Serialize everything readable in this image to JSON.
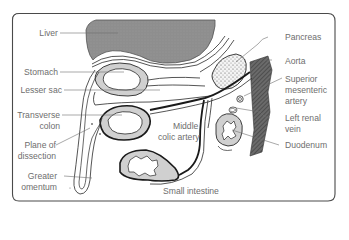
{
  "figure": {
    "colors": {
      "border": "#4a4a4a",
      "liver_fill": "#8c8c8c",
      "organ_wall": "#cfcfcf",
      "line": "#2a2a2a",
      "label_text": "#6e6e6e",
      "aorta_fill": "#5a5a5a"
    }
  },
  "labels": {
    "left": [
      {
        "id": "liver",
        "text": "Liver"
      },
      {
        "id": "stomach",
        "text": "Stomach"
      },
      {
        "id": "lesser_sac",
        "text": "Lesser sac"
      },
      {
        "id": "transverse_colon_1",
        "text": "Transverse"
      },
      {
        "id": "transverse_colon_2",
        "text": "colon"
      },
      {
        "id": "plane_1",
        "text": "Plane of"
      },
      {
        "id": "plane_2",
        "text": "dissection"
      },
      {
        "id": "greater_omentum_1",
        "text": "Greater"
      },
      {
        "id": "greater_omentum_2",
        "text": "omentum"
      }
    ],
    "right": [
      {
        "id": "pancreas",
        "text": "Pancreas"
      },
      {
        "id": "aorta",
        "text": "Aorta"
      },
      {
        "id": "sma_1",
        "text": "Superior"
      },
      {
        "id": "sma_2",
        "text": "mesenteric"
      },
      {
        "id": "sma_3",
        "text": "artery"
      },
      {
        "id": "lrv_1",
        "text": "Left renal"
      },
      {
        "id": "lrv_2",
        "text": "vein"
      },
      {
        "id": "duodenum",
        "text": "Duodenum"
      }
    ],
    "center": [
      {
        "id": "mca_1",
        "text": "Middle"
      },
      {
        "id": "mca_2",
        "text": "colic artery"
      },
      {
        "id": "small_intestine",
        "text": "Small intestine"
      }
    ]
  }
}
